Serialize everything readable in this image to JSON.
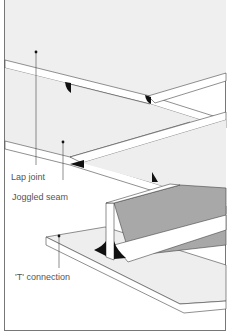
{
  "diagram": {
    "type": "technical-illustration",
    "colors": {
      "plate_fill": "#eeeeee",
      "edge_fill": "#ffffff",
      "shaded_face": "#a8a8a8",
      "weld_bead": "#111111",
      "line": "#444444",
      "frame": "#777777"
    },
    "labels": [
      {
        "id": "lap-joint",
        "text": "Lap joint"
      },
      {
        "id": "joggled-seam",
        "text": "Joggled seam"
      },
      {
        "id": "t-connection",
        "text": "'T' connection"
      }
    ]
  }
}
